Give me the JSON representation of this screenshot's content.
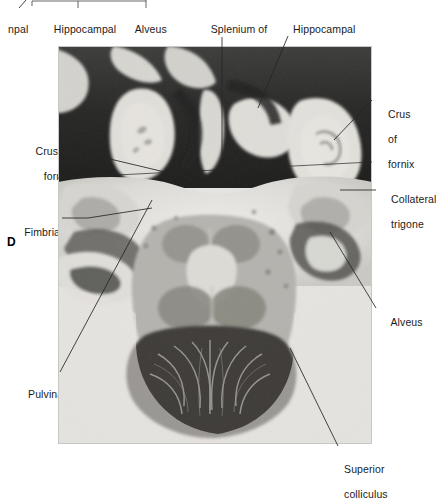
{
  "figure": {
    "panel_letter": "D",
    "plate_caption_type": "anatomical-section-photograph",
    "modality": "stained brain section",
    "plane": "axial / horizontal section",
    "region": "hippocampus, atrium of lateral ventricle and midbrain"
  },
  "labels": {
    "top": [
      {
        "id": "hippocampal-truncated",
        "text": "npal",
        "lines": [
          "npal"
        ]
      },
      {
        "id": "hippocampal-formation",
        "text": "Hippocampal formation",
        "lines": [
          "Hippocampal",
          "formation"
        ]
      },
      {
        "id": "alveus-top",
        "text": "Alveus",
        "lines": [
          "Alveus"
        ]
      },
      {
        "id": "splenium-corpus-callosum",
        "text": "Splenium of corpus callosum",
        "lines": [
          "Splenium of",
          "corpus callosum"
        ]
      },
      {
        "id": "hippocampal-rudiment",
        "text": "Hippocampal rudiment",
        "lines": [
          "Hippocampal",
          "rudiment"
        ]
      }
    ],
    "left": [
      {
        "id": "crus-of-fornix-left",
        "text": "Crus of fornix",
        "lines": [
          "Crus of",
          "fornix"
        ]
      },
      {
        "id": "fimbria",
        "text": "Fimbria",
        "lines": [
          "Fimbria"
        ]
      },
      {
        "id": "pulvinar",
        "text": "Pulvinar",
        "lines": [
          "Pulvinar"
        ]
      }
    ],
    "right": [
      {
        "id": "crus-of-fornix-right",
        "text": "Crus of fornix",
        "lines": [
          "Crus",
          "of",
          "fornix"
        ]
      },
      {
        "id": "collateral-trigone",
        "text": "Collateral trigone",
        "lines": [
          "Collateral",
          "trigone"
        ]
      },
      {
        "id": "alveus-right",
        "text": "Alveus",
        "lines": [
          "Alveus"
        ]
      }
    ],
    "bottom": [
      {
        "id": "superior-colliculus",
        "text": "Superior colliculus",
        "lines": [
          "Superior",
          "colliculus"
        ]
      }
    ]
  },
  "colors": {
    "text": "#1b1b1b",
    "leader": "#262626",
    "page_background": "#ffffff",
    "plate_light": "#ececea",
    "plate_mid": "#9a9a97",
    "plate_dark": "#2a2a2a"
  }
}
